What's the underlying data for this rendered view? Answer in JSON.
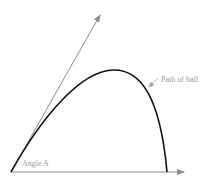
{
  "diagram": {
    "labels": {
      "path": "Path of ball",
      "angle": "Angle A"
    },
    "colors": {
      "curve": "#111111",
      "arrows": "#8c8c8c",
      "text": "#9a9a9a"
    }
  }
}
